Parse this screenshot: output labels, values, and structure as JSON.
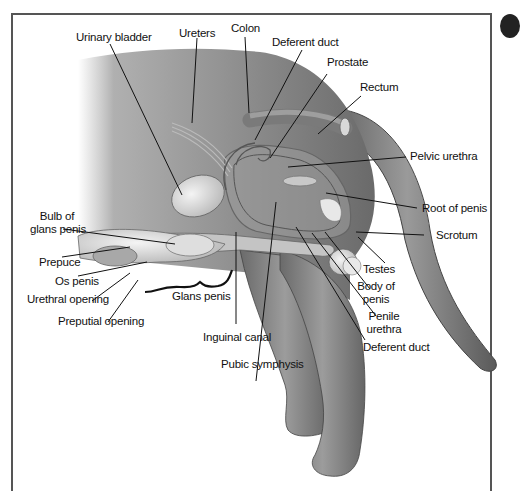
{
  "diagram": {
    "colors": {
      "body_fill": "#8f8f8f",
      "body_dark": "#555555",
      "organ_light": "#d9d9d9",
      "leader_line": "#111111",
      "frame": "#555555"
    },
    "labels": {
      "urinary_bladder": "Urinary bladder",
      "ureters": "Ureters",
      "colon": "Colon",
      "deferent_duct_top": "Deferent duct",
      "prostate": "Prostate",
      "rectum": "Rectum",
      "pelvic_urethra": "Pelvic urethra",
      "root_of_penis": "Root of penis",
      "scrotum": "Scrotum",
      "testes": "Testes",
      "body_of_penis_1": "Body of",
      "body_of_penis_2": "penis",
      "penile_urethra_1": "Penile",
      "penile_urethra_2": "urethra",
      "deferent_duct_bottom": "Deferent duct",
      "pubic_symphysis": "Pubic symphysis",
      "inguinal_canal": "Inguinal canal",
      "glans_penis": "Glans penis",
      "bulb_of_glans_1": "Bulb of",
      "bulb_of_glans_2": "glans penis",
      "prepuce": "Prepuce",
      "os_penis": "Os penis",
      "urethral_opening": "Urethral opening",
      "preputial_opening": "Preputial opening"
    }
  }
}
